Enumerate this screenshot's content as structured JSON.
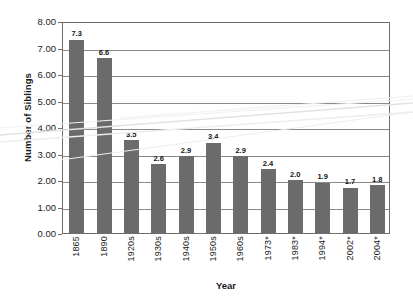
{
  "chart_data": {
    "type": "bar",
    "title": "",
    "xlabel": "Year",
    "ylabel": "Number of Siblings",
    "categories": [
      "1865",
      "1890",
      "1920s",
      "1930s",
      "1940s",
      "1950s",
      "1960s",
      "1973*",
      "1983*",
      "1994*",
      "2002*",
      "2004*"
    ],
    "values": [
      7.3,
      6.6,
      3.5,
      2.6,
      2.9,
      3.4,
      2.9,
      2.4,
      2.0,
      1.9,
      1.7,
      1.8
    ],
    "value_labels": [
      "7.3",
      "6.6",
      "3.5",
      "2.6",
      "2.9",
      "3.4",
      "2.9",
      "2.4",
      "2.0",
      "1.9",
      "1.7",
      "1.8"
    ],
    "ylim": [
      0,
      8
    ],
    "ytick_values": [
      0,
      1,
      2,
      3,
      4,
      5,
      6,
      7,
      8
    ],
    "ytick_labels": [
      "0.00",
      "1.00",
      "2.00",
      "3.00",
      "4.00",
      "5.00",
      "6.00",
      "7.00",
      "8.00"
    ],
    "grid": true,
    "legend": "none",
    "bar_color": "#6b6b6b",
    "gridline_color": "#8a8a8a",
    "axis_color": "#6e6e6e",
    "text_color": "#1a1a1a",
    "background_color": "#ffffff"
  }
}
